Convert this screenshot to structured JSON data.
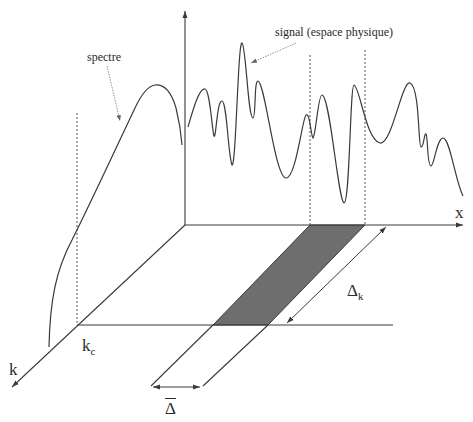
{
  "figure": {
    "labels": {
      "spectrum": "spectre",
      "signal": "signal (espace physique)",
      "x_axis": "x",
      "k_axis": "k",
      "k_cutoff_main": "k",
      "k_cutoff_sub": "c",
      "delta_k_main": "Δ",
      "delta_k_sub": "k",
      "delta_bar": "Δ"
    },
    "colors": {
      "line": "#3a3a3a",
      "band_fill": "#6e6e6e",
      "dotted": "#555555",
      "background": "#ffffff"
    }
  }
}
